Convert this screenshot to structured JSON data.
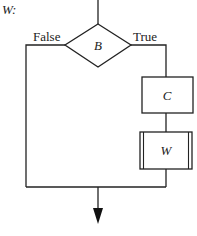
{
  "diagram": {
    "title": "W:",
    "decision": {
      "label": "B"
    },
    "branches": {
      "false_label": "False",
      "true_label": "True"
    },
    "process_box": {
      "label": "C"
    },
    "subroutine_box": {
      "label": "W"
    },
    "colors": {
      "stroke": "#222222",
      "background": "#ffffff"
    }
  }
}
